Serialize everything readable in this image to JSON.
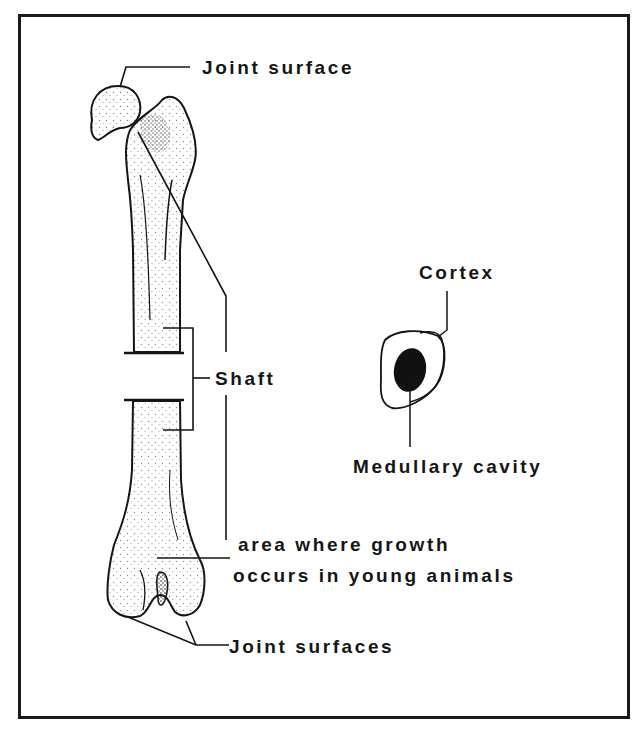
{
  "figure": {
    "colors": {
      "ink": "#141414",
      "background": "#ffffff",
      "frame": "#1a1a1a"
    }
  },
  "labels": {
    "joint_surface_top": "Joint surface",
    "shaft": "Shaft",
    "growth_area_line1": "area where growth",
    "growth_area_line2": "occurs in young animals",
    "joint_surfaces_bottom": "Joint surfaces",
    "cortex": "Cortex",
    "medullary_cavity": "Medullary cavity"
  },
  "illustrations": [
    {
      "name": "femur",
      "description": "Longitudinal drawing of a femur with a section cut out of the shaft"
    },
    {
      "name": "cross-section",
      "description": "Cross-section of the bone shaft showing cortex and medullary cavity"
    }
  ]
}
